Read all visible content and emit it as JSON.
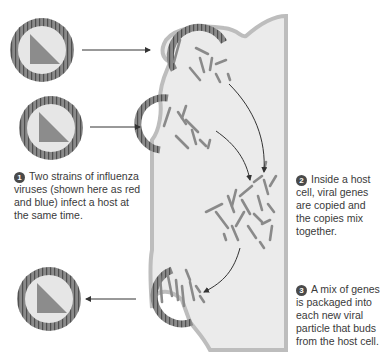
{
  "diagram": {
    "colors": {
      "cell_fill": "#ebebeb",
      "cell_membrane": "#bdbdbd",
      "virus_shell": "#7a7a7a",
      "virus_inner": "#e6e6e6",
      "gene_segment": "#8a8a8a",
      "arrow": "#333333",
      "text": "#3a3a3a",
      "step_badge": "#4a4a4a"
    },
    "steps": [
      {
        "number": "1",
        "text": "Two strains of influenza viruses (shown here as red and blue) infect a host at the same time."
      },
      {
        "number": "2",
        "text": "Inside a host cell, viral genes are copied and the copies mix together."
      },
      {
        "number": "3",
        "text": "A mix of genes is packaged into each new viral particle that buds from the host cell."
      }
    ],
    "elements": {
      "virus_particles_free": 3,
      "budding_virions": 3,
      "arrows": [
        "virus-1-to-cell",
        "virus-2-to-cell",
        "cell-to-mixed-virus",
        "bud-1-to-mix",
        "bud-2-to-mix",
        "mix-to-bud-3"
      ]
    }
  }
}
